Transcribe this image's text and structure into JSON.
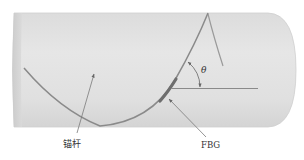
{
  "figure": {
    "labels": {
      "rod": "锚杆",
      "sensor": "FBG",
      "angle": "θ"
    },
    "colors": {
      "cylinder_fill": "#e2e2e2",
      "cylinder_edge": "#c8c8c8",
      "helix": "#8a8a8a",
      "fbg_segment": "#6e6e6e",
      "leader_lines": "#7a7a7a",
      "text": "#333333"
    }
  }
}
